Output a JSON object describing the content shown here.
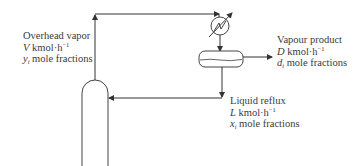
{
  "diagram": {
    "type": "process-flow",
    "colors": {
      "line": "#333333",
      "text": "#3a3a3a",
      "background": "#ffffff"
    },
    "nodes": [
      {
        "id": "column",
        "label": "",
        "shape": "rounded-top-column"
      },
      {
        "id": "condenser",
        "label": "",
        "shape": "heat-exchanger-circle"
      },
      {
        "id": "drum",
        "label": "",
        "shape": "horizontal-vessel"
      }
    ],
    "edges": [
      {
        "from": "column",
        "to": "condenser",
        "label": "overhead_vapor"
      },
      {
        "from": "condenser",
        "to": "drum",
        "label": ""
      },
      {
        "from": "drum",
        "to": "out",
        "label": "vapour_product"
      },
      {
        "from": "drum",
        "to": "column",
        "label": "liquid_reflux"
      }
    ]
  },
  "overhead_vapor": {
    "title": "Overhead vapor",
    "flow_symbol": "V",
    "flow_unit": "kmol·h",
    "flow_exp": "−1",
    "comp_symbol": "y",
    "comp_sub": "i",
    "comp_text": "mole fractions"
  },
  "vapour_product": {
    "title": "Vapour product",
    "flow_symbol": "D",
    "flow_unit": "kmol·h",
    "flow_exp": "−1",
    "comp_symbol": "d",
    "comp_sub": "i",
    "comp_text": "mole fractions"
  },
  "liquid_reflux": {
    "title": "Liquid reflux",
    "flow_symbol": "L",
    "flow_unit": "kmol·h",
    "flow_exp": "−1",
    "comp_symbol": "x",
    "comp_sub": "i",
    "comp_text": "mole fractions"
  }
}
